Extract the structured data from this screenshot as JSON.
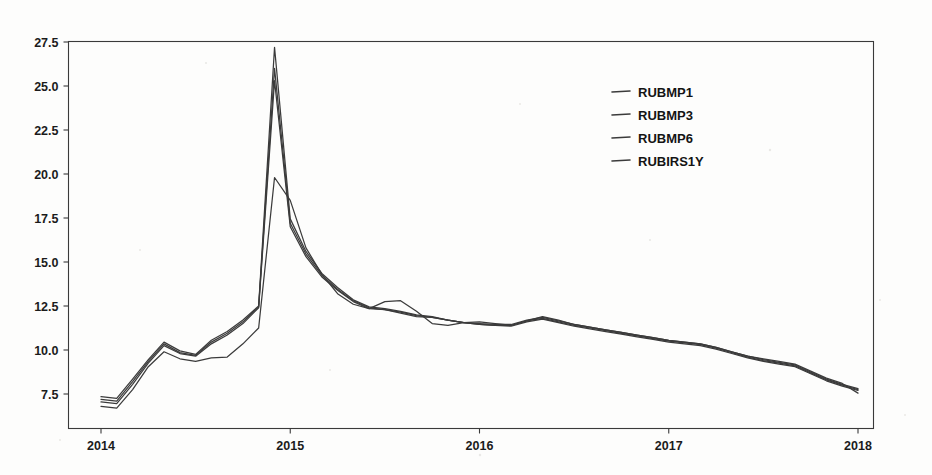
{
  "chart_data": {
    "type": "line",
    "title": "",
    "xlabel": "",
    "ylabel": "",
    "grid": false,
    "legend_position": "upper-right-inside",
    "xlim": [
      2014.0,
      2018.0
    ],
    "ylim": [
      5.57,
      27.95
    ],
    "x_ticks": [
      "2014",
      "2015",
      "2016",
      "2017",
      "2018"
    ],
    "x_tick_values": [
      2014,
      2015,
      2016,
      2017,
      2018
    ],
    "y_ticks": [
      "7.5",
      "10.0",
      "12.5",
      "15.0",
      "17.5",
      "20.0",
      "22.5",
      "25.0",
      "27.5"
    ],
    "y_tick_values": [
      7.5,
      10.0,
      12.5,
      15.0,
      17.5,
      20.0,
      22.5,
      25.0,
      27.5
    ],
    "x": [
      2014.0,
      2014.083,
      2014.167,
      2014.25,
      2014.333,
      2014.417,
      2014.5,
      2014.583,
      2014.667,
      2014.75,
      2014.833,
      2014.917,
      2015.0,
      2015.083,
      2015.167,
      2015.25,
      2015.333,
      2015.417,
      2015.5,
      2015.583,
      2015.667,
      2015.75,
      2015.833,
      2015.917,
      2016.0,
      2016.083,
      2016.167,
      2016.25,
      2016.333,
      2016.417,
      2016.5,
      2016.583,
      2016.667,
      2016.75,
      2016.833,
      2016.917,
      2017.0,
      2017.083,
      2017.167,
      2017.25,
      2017.333,
      2017.417,
      2017.5,
      2017.583,
      2017.667,
      2017.75,
      2017.833,
      2017.917,
      2018.0
    ],
    "series": [
      {
        "name": "RUBMP1",
        "values": [
          7.35,
          7.25,
          8.35,
          9.45,
          10.45,
          9.95,
          9.75,
          10.55,
          11.05,
          11.7,
          12.5,
          27.2,
          17.45,
          15.6,
          14.35,
          13.55,
          12.85,
          12.45,
          12.35,
          12.2,
          12.0,
          11.9,
          11.7,
          11.55,
          11.45,
          11.4,
          11.35,
          11.6,
          11.75,
          11.55,
          11.35,
          11.2,
          11.05,
          10.9,
          10.75,
          10.6,
          10.45,
          10.35,
          10.25,
          10.05,
          9.8,
          9.55,
          9.35,
          9.2,
          9.05,
          8.65,
          8.25,
          7.95,
          7.7
        ]
      },
      {
        "name": "RUBMP3",
        "values": [
          7.2,
          7.1,
          8.2,
          9.35,
          10.35,
          9.85,
          9.7,
          10.45,
          10.95,
          11.6,
          12.45,
          26.0,
          17.2,
          15.45,
          14.25,
          13.45,
          12.8,
          12.4,
          12.3,
          12.15,
          11.95,
          11.85,
          11.7,
          11.55,
          11.45,
          11.4,
          11.4,
          11.65,
          11.8,
          11.6,
          11.4,
          11.25,
          11.1,
          10.95,
          10.8,
          10.65,
          10.5,
          10.4,
          10.3,
          10.1,
          9.85,
          9.6,
          9.4,
          9.25,
          9.1,
          8.7,
          8.3,
          8.0,
          7.75
        ]
      },
      {
        "name": "RUBMP6",
        "values": [
          7.05,
          6.95,
          8.05,
          9.25,
          10.25,
          9.8,
          9.65,
          10.35,
          10.85,
          11.5,
          12.4,
          25.3,
          17.0,
          15.3,
          14.15,
          13.4,
          12.75,
          12.35,
          12.3,
          12.1,
          11.9,
          11.85,
          11.7,
          11.55,
          11.5,
          11.45,
          11.45,
          11.7,
          11.85,
          11.65,
          11.45,
          11.3,
          11.15,
          11.0,
          10.85,
          10.7,
          10.55,
          10.45,
          10.35,
          10.15,
          9.9,
          9.65,
          9.45,
          9.3,
          9.15,
          8.75,
          8.35,
          8.05,
          7.8
        ]
      },
      {
        "name": "RUBIRS1Y",
        "values": [
          6.8,
          6.7,
          7.75,
          9.05,
          9.9,
          9.5,
          9.35,
          9.55,
          9.6,
          10.35,
          11.25,
          19.8,
          18.5,
          15.8,
          14.3,
          13.2,
          12.6,
          12.35,
          12.75,
          12.8,
          12.2,
          11.5,
          11.4,
          11.55,
          11.6,
          11.5,
          11.4,
          11.65,
          11.9,
          11.7,
          11.45,
          11.3,
          11.15,
          11.0,
          10.85,
          10.7,
          10.55,
          10.45,
          10.35,
          10.15,
          9.9,
          9.65,
          9.5,
          9.35,
          9.2,
          8.8,
          8.4,
          8.1,
          7.55
        ]
      }
    ]
  },
  "legend": {
    "entries": [
      {
        "label": "RUBMP1"
      },
      {
        "label": "RUBMP3"
      },
      {
        "label": "RUBMP6"
      },
      {
        "label": "RUBIRS1Y"
      }
    ]
  }
}
